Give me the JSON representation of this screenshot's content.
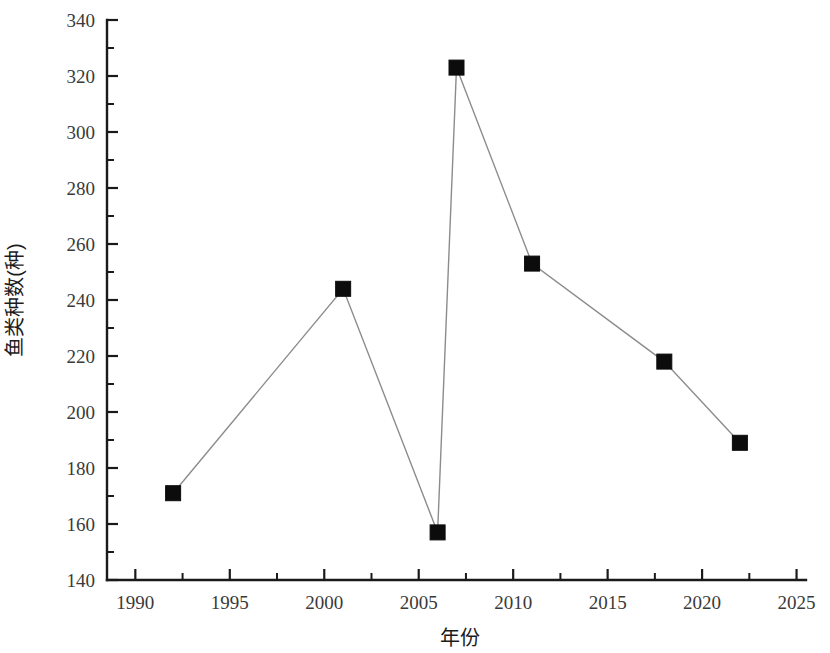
{
  "chart_data": {
    "type": "line",
    "title": "",
    "xlabel": "年份",
    "ylabel": "鱼类种数(种)",
    "x": [
      1992,
      2001,
      2006,
      2007,
      2011,
      2018,
      2022
    ],
    "values": [
      171,
      244,
      157,
      323,
      253,
      218,
      189
    ],
    "series": [
      {
        "name": "鱼类种数(种)",
        "x": [
          1992,
          2001,
          2006,
          2007,
          2011,
          2018,
          2022
        ],
        "values": [
          171,
          244,
          157,
          323,
          253,
          218,
          189
        ]
      }
    ],
    "xlim": [
      1988.5,
      2025.5
    ],
    "ylim": [
      140,
      340
    ],
    "x_tick_labels": [
      "1990",
      "1995",
      "2000",
      "2005",
      "2010",
      "2015",
      "2020",
      "2025"
    ],
    "x_ticks": [
      1990,
      1995,
      2000,
      2005,
      2010,
      2015,
      2020,
      2025
    ],
    "x_minor_step": 2.5,
    "y_tick_labels": [
      "140",
      "160",
      "180",
      "200",
      "220",
      "240",
      "260",
      "280",
      "300",
      "320",
      "340"
    ],
    "y_ticks": [
      140,
      160,
      180,
      200,
      220,
      240,
      260,
      280,
      300,
      320,
      340
    ],
    "y_minor_step": 10,
    "grid": false,
    "legend": false,
    "marker": "square",
    "marker_color": "#0c0c0c",
    "line_color": "#8c8c8c",
    "axis_color": "#1a1a1a",
    "background": "#ffffff"
  }
}
